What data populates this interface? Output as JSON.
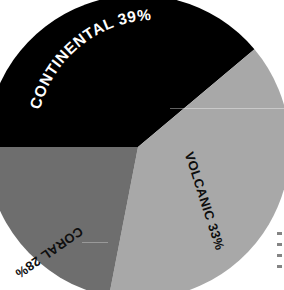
{
  "background_color": "#ffffff",
  "chart_data": {
    "type": "pie",
    "title": "",
    "subtitle": "",
    "xlabel": "",
    "ylabel": "",
    "grid": false,
    "legend_position": "none",
    "label_style": "curved-along-arc",
    "total_percent": 100,
    "center": {
      "x": 138,
      "y": 147
    },
    "radius": 152,
    "categories": [
      "CONTINENTAL",
      "VOLCANIC",
      "CORAL"
    ],
    "values": [
      39,
      33,
      28
    ],
    "slices": [
      {
        "name": "CONTINENTAL",
        "label": "CONTINENTAL 39%",
        "value": 39,
        "percent_text": "39%",
        "color": "#000000",
        "text_color": "#ffffff",
        "start_angle_deg": 180,
        "end_angle_deg": 320
      },
      {
        "name": "VOLCANIC",
        "label": "VOLCANIC 33%",
        "value": 33,
        "percent_text": "33%",
        "color": "#a8a8a8",
        "text_color": "#000000",
        "start_angle_deg": 320,
        "end_angle_deg": 461
      },
      {
        "name": "CORAL",
        "label": "CORAL 28%",
        "value": 28,
        "percent_text": "28%",
        "color": "#6e6e6e",
        "text_color": "#000000",
        "start_angle_deg": 101,
        "end_angle_deg": 180
      }
    ],
    "annotations": [
      "Chart is a scanned print; the pie circle bleeds past the image edges on the left, top and bottom.",
      "Faint horizontal scan streak crosses the light grey slice."
    ]
  },
  "labels": {
    "continental": "CONTINENTAL 39%",
    "volcanic": "VOLCANIC 33%",
    "coral": "CORAL 28%"
  }
}
